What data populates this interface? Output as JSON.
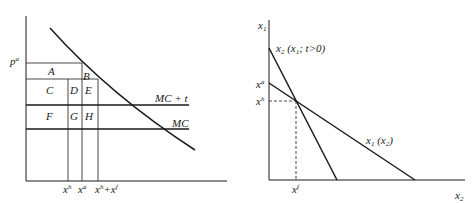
{
  "colors": {
    "ink": "#1a1a1a",
    "background": "#ffffff"
  },
  "left_panel": {
    "price_label": {
      "base": "p",
      "sup": "a"
    },
    "area_labels": [
      "A",
      "B",
      "C",
      "D",
      "E",
      "F",
      "G",
      "H"
    ],
    "curve_labels": {
      "mc_plus_t": "MC + t",
      "mc": "MC"
    },
    "x_ticks": [
      {
        "base": "x",
        "sup": "h"
      },
      {
        "base": "x",
        "sup": "a"
      },
      {
        "base": "x",
        "sup": "h",
        "plus": "+x",
        "sup2": "f"
      }
    ]
  },
  "right_panel": {
    "y_axis": {
      "base": "x",
      "sub": "1"
    },
    "x_axis": {
      "base": "x",
      "sub": "2"
    },
    "y_ticks": [
      {
        "base": "x",
        "sup": "a"
      },
      {
        "base": "x",
        "sup": "h"
      }
    ],
    "x_tick": {
      "base": "x",
      "sup": "f"
    },
    "steep_line_label": {
      "base": "x",
      "sub": "2",
      "rest": " (x",
      "sub2": "1",
      "rest2": "; t>0)"
    },
    "shallow_line_label": {
      "base": "x",
      "sub": "1",
      "rest": " (x",
      "sub2": "2",
      "rest2": ")"
    }
  }
}
